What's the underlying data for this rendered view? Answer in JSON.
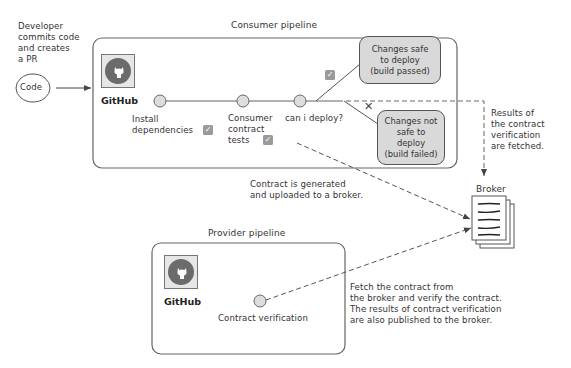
{
  "diagram": {
    "developer_note": "Developer\ncommits code\nand creates\na PR",
    "code_node": "Code",
    "consumer_pipeline": {
      "title": "Consumer pipeline",
      "github_label": "GitHub",
      "steps": [
        {
          "label": "Install\ndependencies",
          "status": "passed"
        },
        {
          "label": "Consumer\ncontract\ntests",
          "status": "passed"
        },
        {
          "label": "can i deploy?",
          "status": "decision"
        }
      ],
      "outcomes": {
        "safe": "Changes safe\nto deploy\n(build passed)",
        "not_safe": "Changes not\nsafe to\ndeploy\n(build failed)"
      },
      "check_mark": "✓",
      "fail_mark": "✕"
    },
    "provider_pipeline": {
      "title": "Provider pipeline",
      "github_label": "GitHub",
      "step": "Contract verification"
    },
    "broker": {
      "label": "Broker"
    },
    "annotations": {
      "contract_upload": "Contract is generated\nand uploaded to a broker.",
      "results_fetched": "Results of\nthe contract\nverification\nare fetched.",
      "provider_fetch": "Fetch the contract from\nthe broker and verify the contract.\nThe results of contract verification\nare also published to the broker."
    },
    "colors": {
      "stroke": "#555555",
      "node_fill": "#dddddd",
      "decision_fill": "#d9d9d9",
      "github_disc": "#6b6b6b",
      "check_fill": "#9a9a9a"
    }
  }
}
